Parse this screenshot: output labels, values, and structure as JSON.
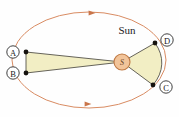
{
  "figure": {
    "name": "kepler-equal-areas-diagram",
    "title_label": "Sun",
    "background_color": "#fefefe"
  },
  "colors": {
    "orbit_stroke": "#d98c63",
    "sector_fill": "#f2eec4",
    "sector_stroke": "#55524a",
    "sun_fill": "#f2c49a",
    "sun_stroke": "#c07a45",
    "point_fill": "#16130f",
    "label_text": "#1a1a1a",
    "label_ring": "#2b2b2b"
  },
  "sun": {
    "label": "S",
    "caption": "Sun",
    "cx": 122,
    "cy": 62,
    "r": 8
  },
  "orbit": {
    "cx": 89,
    "cy": 60,
    "rx": 77,
    "ry": 48,
    "stroke_width": 1
  },
  "arrows": [
    {
      "name": "orbit-direction-arrow-top",
      "x": 92,
      "y": 13,
      "rotation": 0
    },
    {
      "name": "orbit-direction-arrow-bottom",
      "x": 88,
      "y": 104,
      "rotation": 0
    }
  ],
  "points": [
    {
      "id": "A",
      "label": "A",
      "px": 26,
      "py": 52,
      "lx": 13,
      "ly": 52
    },
    {
      "id": "B",
      "label": "B",
      "px": 26,
      "py": 73,
      "lx": 13,
      "ly": 73
    },
    {
      "id": "C",
      "label": "C",
      "px": 153,
      "py": 85,
      "lx": 166,
      "ly": 87
    },
    {
      "id": "D",
      "label": "D",
      "px": 155,
      "py": 43,
      "lx": 167,
      "ly": 40
    }
  ],
  "sectors": [
    {
      "name": "swept-area-sector-ab",
      "description": "thin elongated sector from Sun to points A and B (aphelion side)",
      "path": "M122,62 L26,52 L26,73 Z"
    },
    {
      "name": "swept-area-sector-dc",
      "description": "wide short sector from Sun to points D and C (perihelion side)",
      "path": "M122,62 L155,43 A77,48 0 0 1 153,85 Z"
    }
  ]
}
